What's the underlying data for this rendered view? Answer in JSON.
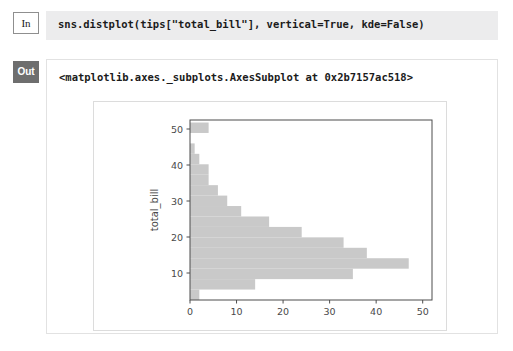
{
  "notebook": {
    "input_prompt_label": "In",
    "output_prompt_label": "Out",
    "code": "sns.distplot(tips[\"total_bill\"], vertical=True, kde=False)",
    "output_repr": "<matplotlib.axes._subplots.AxesSubplot at 0x2b7157ac518>"
  },
  "colors": {
    "bar_fill": "#c9c9c9",
    "axis_line": "#4d4d4d",
    "tick_label": "#4a4a4a",
    "in_cell_bg": "#ececed",
    "out_prompt_bg": "#6e6e6e",
    "figure_bg": "#ffffff",
    "figure_border": "#dcdcdc"
  },
  "chart_data": {
    "type": "bar",
    "orientation": "horizontal",
    "title": "",
    "xlabel": "",
    "ylabel": "total_bill",
    "xlim": [
      0,
      52
    ],
    "ylim": [
      2.5,
      52.5
    ],
    "xticks": [
      0,
      10,
      20,
      30,
      40,
      50
    ],
    "xtick_labels": [
      "0",
      "10",
      "20",
      "30",
      "40",
      "50"
    ],
    "yticks": [
      10,
      20,
      30,
      40,
      50
    ],
    "ytick_labels": [
      "10",
      "20",
      "30",
      "40",
      "50"
    ],
    "grid": false,
    "legend": null,
    "bin_edges": [
      2.5,
      5.4,
      8.3,
      11.2,
      14.1,
      17.0,
      19.9,
      22.8,
      25.7,
      28.6,
      31.5,
      34.4,
      37.3,
      40.2,
      43.1,
      46.0,
      48.9,
      51.8
    ],
    "bin_centers": [
      3.95,
      6.85,
      9.75,
      12.65,
      15.55,
      18.45,
      21.35,
      24.25,
      27.15,
      30.05,
      32.95,
      35.85,
      38.75,
      41.65,
      44.55,
      47.45,
      50.35
    ],
    "counts": [
      2,
      14,
      35,
      47,
      38,
      33,
      24,
      17,
      11,
      8,
      6,
      4,
      4,
      2,
      1,
      0,
      4
    ],
    "series": [
      {
        "name": "total_bill",
        "values": [
          2,
          14,
          35,
          47,
          38,
          33,
          24,
          17,
          11,
          8,
          6,
          4,
          4,
          2,
          1,
          0,
          4
        ]
      }
    ]
  }
}
